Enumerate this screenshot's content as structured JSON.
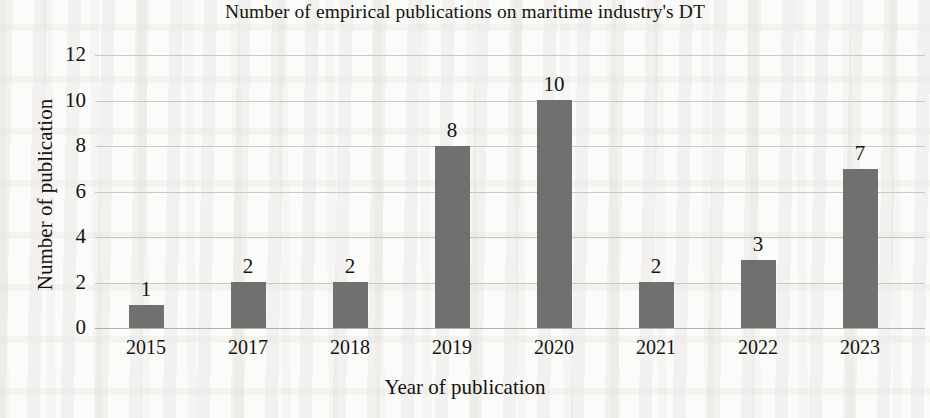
{
  "chart_data": {
    "type": "bar",
    "title": "Number of empirical publications on maritime industry's DT",
    "xlabel": "Year of publication",
    "ylabel": "Number of publication",
    "categories": [
      "2015",
      "2017",
      "2018",
      "2019",
      "2020",
      "2021",
      "2022",
      "2023"
    ],
    "values": [
      1,
      2,
      2,
      8,
      10,
      2,
      3,
      7
    ],
    "data_labels": [
      "1",
      "2",
      "2",
      "8",
      "10",
      "2",
      "3",
      "7"
    ],
    "ylim": [
      0,
      12
    ],
    "yticks": [
      12,
      10,
      8,
      6,
      4,
      2,
      0
    ],
    "ytick_labels": [
      "12",
      "10",
      "8",
      "6",
      "4",
      "2",
      "0"
    ],
    "grid": "horizontal",
    "legend": "none",
    "series": [
      {
        "name": "Number of publication",
        "color": "#70706e",
        "values": [
          1,
          2,
          2,
          8,
          10,
          2,
          3,
          7
        ]
      }
    ],
    "colors": {
      "bar": "#70706e",
      "gridline": "#c9c9c4",
      "baseline": "#b0b0aa",
      "text": "#15140f",
      "background": "#fbfbf9"
    }
  }
}
